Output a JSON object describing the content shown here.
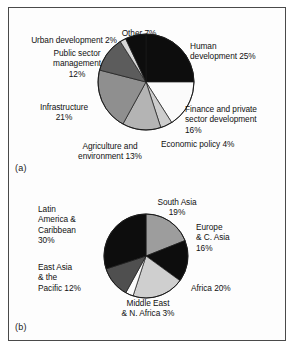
{
  "figure": {
    "panel_a_tag": "(a)",
    "panel_b_tag": "(b)"
  },
  "chart_data": [
    {
      "type": "pie",
      "id": "a",
      "title": "",
      "panel_label": "(a)",
      "start_angle_deg": 0,
      "direction": "clockwise",
      "total": 100,
      "unit": "%",
      "categories": [
        "Human development",
        "Finance and private sector development",
        "Economic policy",
        "Agriculture and environment",
        "Infrastructure",
        "Public sector management",
        "Urban development",
        "Other"
      ],
      "values": [
        25,
        16,
        4,
        13,
        21,
        12,
        2,
        7
      ],
      "colors": [
        "#0d0d0d",
        "#fbfbfb",
        "#cdcdcd",
        "#b4b4b4",
        "#8f8f8f",
        "#5c5c5c",
        "#d8d8d8",
        "#0d0d0d"
      ],
      "labels": [
        {
          "key": "human_development",
          "text": "Human\ndevelopment 25%",
          "value": 25
        },
        {
          "key": "finance_private_sector",
          "text": "Finance and private\nsector development\n16%",
          "value": 16
        },
        {
          "key": "economic_policy",
          "text": "Economic policy 4%",
          "value": 4
        },
        {
          "key": "agriculture_environment",
          "text": "Agriculture and\nenvironment 13%",
          "value": 13
        },
        {
          "key": "infrastructure",
          "text": "Infrastructure\n21%",
          "value": 21
        },
        {
          "key": "public_sector_management",
          "text": "Public sector\nmanagement\n12%",
          "value": 12
        },
        {
          "key": "urban_development",
          "text": "Urban development 2%",
          "value": 2
        },
        {
          "key": "other",
          "text": "Other 7%",
          "value": 7
        }
      ]
    },
    {
      "type": "pie",
      "id": "b",
      "title": "",
      "panel_label": "(b)",
      "start_angle_deg": 0,
      "direction": "clockwise",
      "total": 100,
      "unit": "%",
      "categories": [
        "South Asia",
        "Europe & C. Asia",
        "Africa",
        "Middle East & N. Africa",
        "East Asia & the Pacific",
        "Latin America & Caribbean"
      ],
      "values": [
        19,
        16,
        20,
        3,
        12,
        30
      ],
      "colors": [
        "#9d9d9d",
        "#0d0d0d",
        "#cfcfcf",
        "#fbfbfb",
        "#4f4f4f",
        "#0d0d0d"
      ],
      "labels": [
        {
          "key": "south_asia",
          "text": "South Asia\n19%",
          "value": 19
        },
        {
          "key": "europe_c_asia",
          "text": "Europe\n& C. Asia\n16%",
          "value": 16
        },
        {
          "key": "africa",
          "text": "Africa 20%",
          "value": 20
        },
        {
          "key": "middle_east_n_africa",
          "text": "Middle East\n& N. Africa 3%",
          "value": 3
        },
        {
          "key": "east_asia_pacific",
          "text": "East Asia\n& the\nPacific 12%",
          "value": 12
        },
        {
          "key": "latin_america_caribbean",
          "text": "Latin\nAmerica &\nCaribbean\n30%",
          "value": 30
        }
      ]
    }
  ]
}
